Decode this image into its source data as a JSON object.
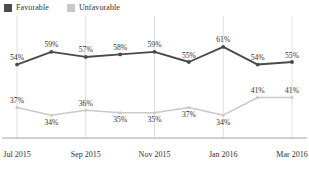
{
  "legend": {
    "position": "top-left",
    "items": [
      {
        "label": "Favorable",
        "color": "#4a4a4a",
        "icon": "square-swatch"
      },
      {
        "label": "Unfavorable",
        "color": "#c9c9c9",
        "icon": "square-swatch"
      }
    ]
  },
  "chart_data": {
    "type": "line",
    "title": "",
    "subtitle": "",
    "xlabel": "",
    "ylabel": "",
    "ylim": [
      25,
      70
    ],
    "grid": "vertical-only",
    "legend_position": "top-left",
    "x": [
      "Jul 2015",
      "Aug 2015",
      "Sep 2015",
      "Oct 2015",
      "Nov 2015",
      "Dec 2015",
      "Jan 2016",
      "Feb 2016",
      "Mar 2016"
    ],
    "xtick_labels": [
      "Jul 2015",
      "Sep 2015",
      "Nov 2015",
      "Jan 2016",
      "Mar 2016"
    ],
    "xtick_indices": [
      0,
      2,
      4,
      6,
      8
    ],
    "series": [
      {
        "name": "Favorable",
        "color": "#4a4a4a",
        "values": [
          54,
          59,
          57,
          58,
          59,
          55,
          61,
          54,
          55
        ],
        "point_labels": [
          "54%",
          "59%",
          "57%",
          "58%",
          "59%",
          "55%",
          "61%",
          "54%",
          "55%"
        ]
      },
      {
        "name": "Unfavorable",
        "color": "#c9c9c9",
        "values": [
          37,
          34,
          36,
          35,
          35,
          37,
          34,
          41,
          41
        ],
        "point_labels": [
          "37%",
          "34%",
          "36%",
          "35%",
          "35%",
          "37%",
          "34%",
          "41%",
          "41%"
        ]
      }
    ]
  },
  "axis": {
    "baseline_color": "#9a9a9a",
    "gridline_color": "#d8d8d8"
  }
}
